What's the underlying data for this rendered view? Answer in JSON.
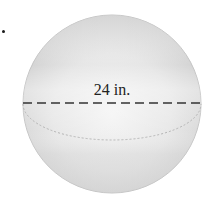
{
  "figure": {
    "type": "sphere",
    "label": "24 in.",
    "measurement": {
      "value": 24,
      "unit": "in.",
      "kind": "diameter"
    },
    "colors": {
      "sphere_fill_light": "#f2f2f2",
      "sphere_fill_mid": "#e2e2e2",
      "sphere_fill_dark": "#cfcfcf",
      "outline": "#bdbdbd",
      "dashed_line": "#333333",
      "equator": "#b8b8b8",
      "label": "#222222"
    }
  }
}
